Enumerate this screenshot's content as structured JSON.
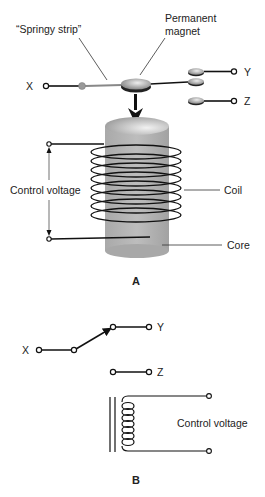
{
  "figure_a": {
    "caption": "A",
    "labels": {
      "springy_strip": "“Springy strip”",
      "permanent_magnet_line1": "Permanent",
      "permanent_magnet_line2": "magnet",
      "x": "X",
      "y": "Y",
      "z": "Z",
      "control_voltage": "Control voltage",
      "coil": "Coil",
      "core": "Core"
    }
  },
  "figure_b": {
    "caption": "B",
    "labels": {
      "x": "X",
      "y": "Y",
      "z": "Z",
      "control_voltage": "Control voltage"
    }
  },
  "colors": {
    "line": "#111111",
    "core_fill": "#b3b3b3",
    "core_top": "#d8d8d8",
    "strip": "#888888",
    "background": "#ffffff"
  }
}
